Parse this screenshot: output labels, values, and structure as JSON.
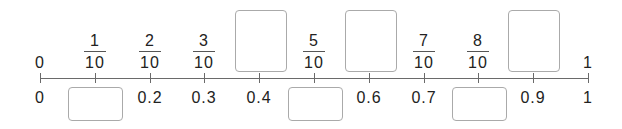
{
  "axis": {
    "start": 0,
    "end": 1,
    "divisions": 10,
    "line_color": "#6a6a6a"
  },
  "top_labels": [
    {
      "type": "text",
      "value": "0"
    },
    {
      "type": "fraction",
      "num": "1",
      "den": "10"
    },
    {
      "type": "fraction",
      "num": "2",
      "den": "10"
    },
    {
      "type": "fraction",
      "num": "3",
      "den": "10"
    },
    {
      "type": "blank"
    },
    {
      "type": "fraction",
      "num": "5",
      "den": "10"
    },
    {
      "type": "blank"
    },
    {
      "type": "fraction",
      "num": "7",
      "den": "10"
    },
    {
      "type": "fraction",
      "num": "8",
      "den": "10"
    },
    {
      "type": "blank"
    },
    {
      "type": "text",
      "value": "1"
    }
  ],
  "bottom_labels": [
    {
      "type": "text",
      "value": "0"
    },
    {
      "type": "blank"
    },
    {
      "type": "text",
      "value": "0.2"
    },
    {
      "type": "text",
      "value": "0.3"
    },
    {
      "type": "text",
      "value": "0.4"
    },
    {
      "type": "blank"
    },
    {
      "type": "text",
      "value": "0.6"
    },
    {
      "type": "text",
      "value": "0.7"
    },
    {
      "type": "blank"
    },
    {
      "type": "text",
      "value": "0.9"
    },
    {
      "type": "text",
      "value": "1"
    }
  ]
}
